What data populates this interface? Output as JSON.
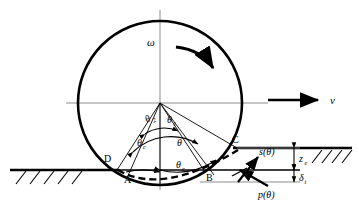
{
  "figure": {
    "name": "wheel-soil-interaction-diagram",
    "colors": {
      "ink": "#000000",
      "axis": "#555555",
      "paper": "#ffffff"
    }
  },
  "geometry": {
    "wheel_center": {
      "x": 160,
      "y": 103
    },
    "wheel_radius": 82,
    "ground_left_y": 170,
    "ground_right_y": 148,
    "entry_point": {
      "x": 237,
      "y": 148
    },
    "exit_point": {
      "x": 117,
      "y": 170
    }
  },
  "labels": {
    "omega": "ω",
    "velocity": "v",
    "theta_1": "θ",
    "theta_1_sub": "1",
    "theta_2": "θ",
    "theta_2_sub": "2",
    "theta": "θ",
    "theta_c_upper": "θ",
    "theta_c_upper_sub": "c",
    "theta_c_lower": "θ",
    "theta_c_lower_sub": "c",
    "point_a": "A",
    "point_b": "B",
    "point_c": "C",
    "point_d": "D",
    "shear_stress": "s(θ)",
    "normal_pressure": "p(θ)",
    "sinkage": "z",
    "sinkage_sub": "e",
    "rut_depth": "δ",
    "rut_depth_sub": "t"
  },
  "annotations": {
    "rotation_arrow": "clockwise-rotation-arrow",
    "velocity_arrow": "forward-velocity-arrow",
    "stress_arrows": [
      "shear-stress-arrow",
      "normal-pressure-arrow"
    ],
    "ground_hatching": "soil-surface-hatching",
    "deformed_surface": "dashed-rut-profile"
  }
}
